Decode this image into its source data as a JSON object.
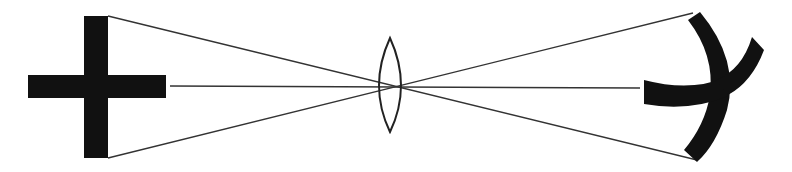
{
  "diagram": {
    "title": "Lens imaging of a cross showing curvature of the image",
    "colors": {
      "background": "#ffffff",
      "ink": "#111111",
      "ray": "#333333"
    },
    "elements": {
      "object": "cross",
      "lens": "biconvex-lens",
      "image": "curved-distorted-cross"
    }
  }
}
